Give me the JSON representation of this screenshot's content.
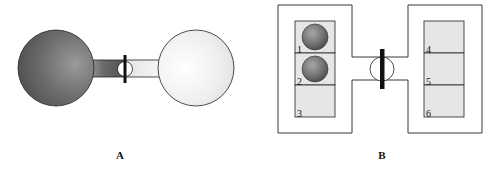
{
  "panels": [
    {
      "id": "A",
      "caption": "A",
      "description": "Two spherical bulbs connected by a tube with a stopcock valve; left bulb filled with dark gas, right bulb light/empty",
      "left_bulb": {
        "fill": "#6e6e6e",
        "state": "filled"
      },
      "right_bulb": {
        "fill": "#e8e8e8",
        "state": "empty"
      },
      "valve": {
        "state": "closed"
      }
    },
    {
      "id": "B",
      "caption": "B",
      "description": "Two boxes connected by a channel with a closed valve; left box has cells 1-3, right box has cells 4-6",
      "left_box": {
        "cells": [
          {
            "label": "1",
            "has_particle": true
          },
          {
            "label": "2",
            "has_particle": true
          },
          {
            "label": "3",
            "has_particle": false
          }
        ]
      },
      "right_box": {
        "cells": [
          {
            "label": "4",
            "has_particle": false
          },
          {
            "label": "5",
            "has_particle": false
          },
          {
            "label": "6",
            "has_particle": false
          }
        ]
      },
      "valve": {
        "state": "closed"
      }
    }
  ],
  "colors": {
    "cell_fill": "#e6e6e6",
    "particle": "#6f6f6f",
    "line": "#222222",
    "valve_bar": "#111111"
  }
}
